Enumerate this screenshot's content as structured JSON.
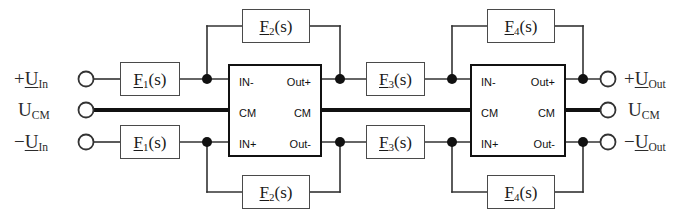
{
  "diagram": {
    "colors": {
      "wire": "#333333",
      "block_border": "#4a4a4a",
      "amplifier_border": "#111111",
      "cm_line": "#111111",
      "background": "#ffffff",
      "text": "#1a1a1a"
    }
  },
  "inputs": {
    "positive": {
      "sign": "+",
      "symbol": "U",
      "subscript": "In"
    },
    "common_mode": {
      "sign": "",
      "symbol": "U",
      "subscript": "CM"
    },
    "negative": {
      "sign": "−",
      "symbol": "U",
      "subscript": "In"
    }
  },
  "outputs": {
    "positive": {
      "sign": "+",
      "symbol": "U",
      "subscript": "Out"
    },
    "common_mode": {
      "sign": "",
      "symbol": "U",
      "subscript": "CM"
    },
    "negative": {
      "sign": "−",
      "symbol": "U",
      "subscript": "Out"
    }
  },
  "blocks": {
    "f1_top": {
      "symbol": "F",
      "index": "1",
      "arg": "(s)"
    },
    "f1_bottom": {
      "symbol": "F",
      "index": "1",
      "arg": "(s)"
    },
    "f2_top": {
      "symbol": "F",
      "index": "2",
      "arg": "(s)"
    },
    "f2_bottom": {
      "symbol": "F",
      "index": "2",
      "arg": "(s)"
    },
    "f3_top": {
      "symbol": "F",
      "index": "3",
      "arg": "(s)"
    },
    "f3_bottom": {
      "symbol": "F",
      "index": "3",
      "arg": "(s)"
    },
    "f4_top": {
      "symbol": "F",
      "index": "4",
      "arg": "(s)"
    },
    "f4_bottom": {
      "symbol": "F",
      "index": "4",
      "arg": "(s)"
    }
  },
  "amplifiers": {
    "stage1": {
      "in_minus": "IN-",
      "cm_in": "CM",
      "in_plus": "IN+",
      "out_plus": "Out+",
      "cm_out": "CM",
      "out_minus": "Out-"
    },
    "stage2": {
      "in_minus": "IN-",
      "cm_in": "CM",
      "in_plus": "IN+",
      "out_plus": "Out+",
      "cm_out": "CM",
      "out_minus": "Out-"
    }
  }
}
